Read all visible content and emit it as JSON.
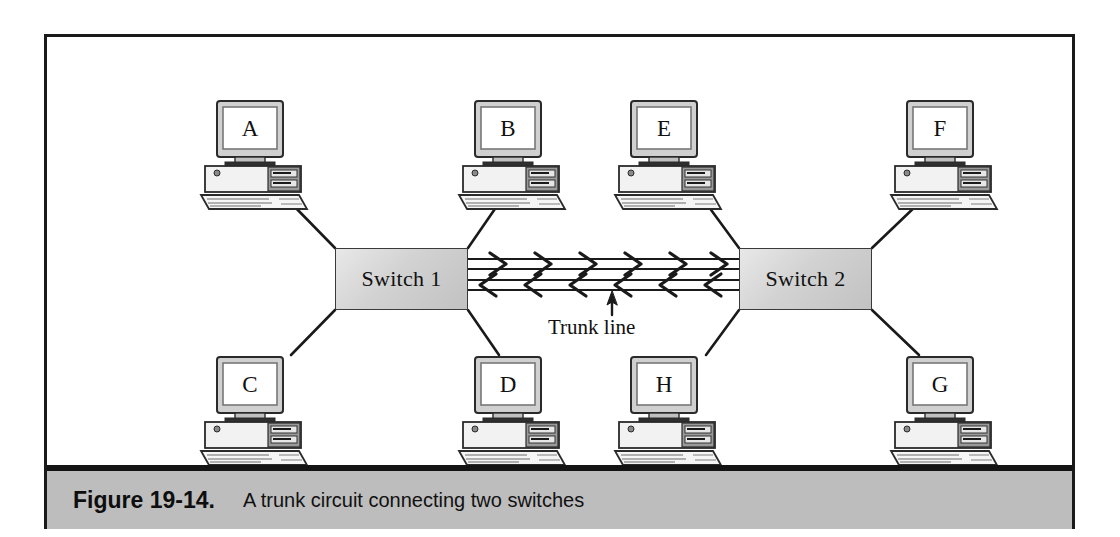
{
  "figure": {
    "caption_number": "Figure 19-14.",
    "caption_text": "A trunk circuit connecting two switches",
    "band_color": "#bdbdbd",
    "frame_color": "#1a1a1a"
  },
  "diagram": {
    "type": "network-topology",
    "trunk_label": "Trunk line",
    "switches": [
      {
        "id": "switch-1",
        "label": "Switch 1",
        "x": 288,
        "y": 211,
        "width": 133,
        "height": 62
      },
      {
        "id": "switch-2",
        "label": "Switch 2",
        "x": 692,
        "y": 211,
        "width": 133,
        "height": 62
      }
    ],
    "workstations": [
      {
        "id": "ws-a",
        "letter": "A",
        "x": 148,
        "y": 62,
        "switch": "switch-1",
        "row": "top"
      },
      {
        "id": "ws-b",
        "letter": "B",
        "x": 406,
        "y": 62,
        "switch": "switch-1",
        "row": "top"
      },
      {
        "id": "ws-e",
        "letter": "E",
        "x": 562,
        "y": 62,
        "switch": "switch-2",
        "row": "top"
      },
      {
        "id": "ws-f",
        "letter": "F",
        "x": 838,
        "y": 62,
        "switch": "switch-2",
        "row": "top"
      },
      {
        "id": "ws-c",
        "letter": "C",
        "x": 148,
        "y": 318,
        "switch": "switch-1",
        "row": "bottom"
      },
      {
        "id": "ws-d",
        "letter": "D",
        "x": 406,
        "y": 318,
        "switch": "switch-1",
        "row": "bottom"
      },
      {
        "id": "ws-h",
        "letter": "H",
        "x": 562,
        "y": 318,
        "switch": "switch-2",
        "row": "bottom"
      },
      {
        "id": "ws-g",
        "letter": "G",
        "x": 838,
        "y": 318,
        "switch": "switch-2",
        "row": "bottom"
      }
    ],
    "trunk": {
      "direction_top": "right",
      "direction_bottom": "left",
      "arrow_count": 6,
      "x_start": 421,
      "x_end": 692,
      "y_top": 227,
      "y_bottom": 248
    }
  }
}
